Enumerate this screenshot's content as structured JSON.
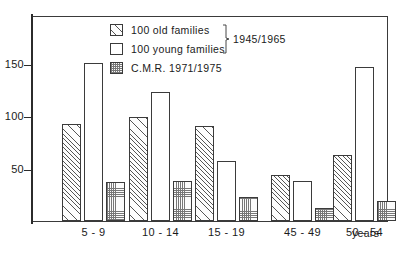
{
  "chart_data": {
    "type": "bar",
    "title": "",
    "xlabel": "years",
    "ylabel": "",
    "ylim": [
      0,
      175
    ],
    "yticks": [
      50,
      100,
      150
    ],
    "grid": false,
    "legend_position": "top-center",
    "categories": [
      "5 - 9",
      "10 - 14",
      "15 - 19",
      "45 - 49",
      "50 - 54"
    ],
    "series": [
      {
        "name": "100 old families",
        "pattern": "diagonal-hatch",
        "values": [
          93,
          99,
          91,
          44,
          63
        ]
      },
      {
        "name": "100 young families",
        "pattern": "empty",
        "values": [
          151,
          123,
          57,
          38,
          147
        ]
      },
      {
        "name": "C.M.R. 1971/1975",
        "pattern": "dotted-grid",
        "values": [
          37,
          38,
          23,
          12,
          19
        ]
      }
    ],
    "annotations": [
      "1945/1965"
    ]
  },
  "axes": {
    "y_tick_labels": [
      "150",
      "100",
      "50"
    ],
    "x_tick_labels": [
      "5 - 9",
      "10 - 14",
      "15 - 19",
      "45 - 49",
      "50 - 54"
    ],
    "x_unit_label": "years"
  },
  "legend": {
    "items": [
      {
        "label": "100 old families",
        "swatch": "hatch-swatch-icon"
      },
      {
        "label": "100 young families",
        "swatch": "empty-swatch-icon"
      },
      {
        "label": "C.M.R. 1971/1975",
        "swatch": "dots-swatch-icon"
      }
    ],
    "brace_label": "1945/1965"
  },
  "colors": {
    "frame": "#3a3a3a",
    "bar_outline": "#3b3b3b",
    "hatch_line": "#555555",
    "dots": "#777777",
    "background": "#ffffff",
    "text": "#1a1a1a"
  }
}
